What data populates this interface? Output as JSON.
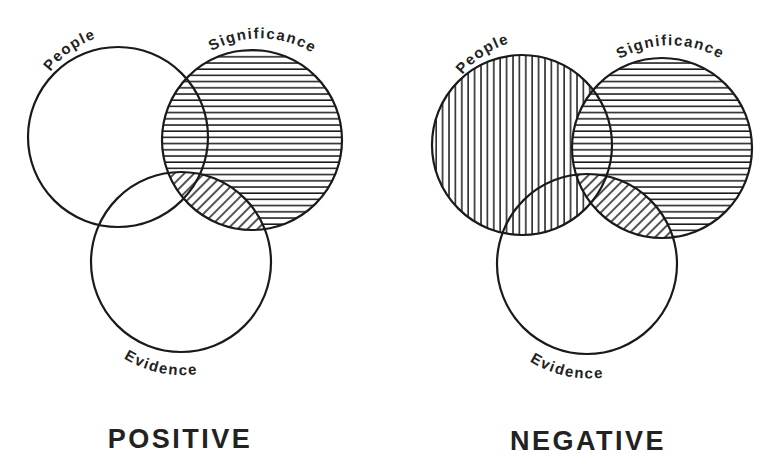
{
  "figure": {
    "background": "#ffffff",
    "ink_color": "#1a1a1a"
  },
  "diagrams": [
    {
      "id": "positive",
      "title": "POSITIVE",
      "circles": [
        {
          "label": "People",
          "cx": 118,
          "cy": 137,
          "r": 90,
          "fill": "none"
        },
        {
          "label": "Significance",
          "cx": 252,
          "cy": 140,
          "r": 90,
          "fill": "horizontal-hatch"
        },
        {
          "label": "Evidence",
          "cx": 181,
          "cy": 262,
          "r": 90,
          "fill": "none"
        }
      ],
      "intersections": [
        {
          "sets": [
            "Significance",
            "Evidence"
          ],
          "fill": "diagonal-hatch"
        }
      ]
    },
    {
      "id": "negative",
      "title": "NEGATIVE",
      "circles": [
        {
          "label": "People",
          "cx": 522,
          "cy": 145,
          "r": 90,
          "fill": "vertical-hatch"
        },
        {
          "label": "Significance",
          "cx": 662,
          "cy": 148,
          "r": 90,
          "fill": "horizontal-hatch"
        },
        {
          "label": "Evidence",
          "cx": 587,
          "cy": 264,
          "r": 90,
          "fill": "none"
        }
      ],
      "intersections": [
        {
          "sets": [
            "Significance",
            "Evidence"
          ],
          "fill": "diagonal-hatch"
        }
      ]
    }
  ],
  "labels": {
    "positive": {
      "people": "People",
      "significance": "Significance",
      "evidence": "Evidence",
      "title": "POSITIVE"
    },
    "negative": {
      "people": "People",
      "significance": "Significance",
      "evidence": "Evidence",
      "title": "NEGATIVE"
    }
  }
}
